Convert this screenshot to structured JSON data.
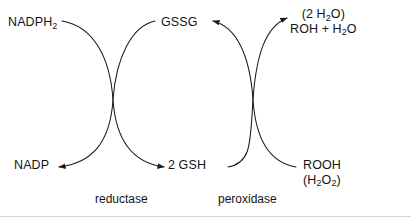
{
  "diagram": {
    "stroke_color": "#1a1a1a",
    "background_color": "#ffffff",
    "rule_color": "#d2d2d2"
  },
  "nodes": {
    "nadph2": {
      "text_main": "NADPH",
      "subscript": "2"
    },
    "gssg": {
      "text_main": "GSSG"
    },
    "products": {
      "line1": "(2 H",
      "line1_sub": "2",
      "line1_tail": "O)",
      "line2_a": "ROH + H",
      "line2_sub": "2",
      "line2_tail": "O"
    },
    "nadp": {
      "text_main": "NADP"
    },
    "gsh": {
      "text_main": "2 GSH"
    },
    "rooh": {
      "line1": "ROOH",
      "line2_a": "(H",
      "line2_sub1": "2",
      "line2_mid": "O",
      "line2_sub2": "2",
      "line2_tail": ")"
    }
  },
  "enzymes": {
    "left": "reductase",
    "right": "peroxidase"
  },
  "arrows": [
    {
      "name": "nadph2-to-gsh",
      "from": "NADPH2",
      "to": "2 GSH",
      "direction": "right"
    },
    {
      "name": "gssg-to-nadp",
      "from": "GSSG",
      "to": "NADP",
      "direction": "left"
    },
    {
      "name": "gsh-to-products",
      "from": "2 GSH",
      "to": "(2 H2O) ROH + H2O",
      "direction": "right"
    },
    {
      "name": "rooh-to-gssg",
      "from": "ROOH",
      "to": "GSSG",
      "direction": "left"
    }
  ]
}
